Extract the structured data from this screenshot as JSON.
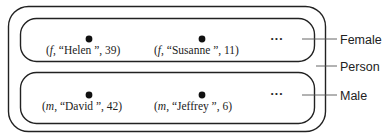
{
  "diagram": {
    "outer_set": {
      "label": "Person"
    },
    "subsets": [
      {
        "label": "Female",
        "ellipsis": "···",
        "elements": [
          {
            "gender": "f",
            "name": "Helen",
            "age": "39"
          },
          {
            "gender": "f",
            "name": "Susanne",
            "age": "11"
          }
        ]
      },
      {
        "label": "Male",
        "ellipsis": "···",
        "elements": [
          {
            "gender": "m",
            "name": "David",
            "age": "42"
          },
          {
            "gender": "m",
            "name": "Jeffrey",
            "age": "6"
          }
        ]
      }
    ]
  }
}
